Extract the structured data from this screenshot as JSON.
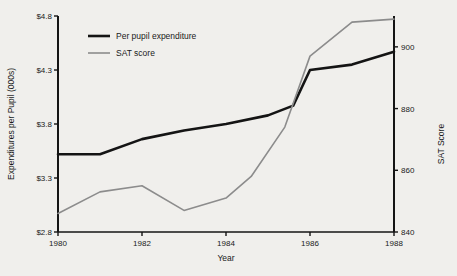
{
  "chart_data": {
    "type": "line",
    "title": "",
    "xlabel": "Year",
    "ylabel": "Expenditures per Pupil (000s)",
    "y2label": "SAT Score",
    "x": [
      1980,
      1981,
      1982,
      1983,
      1984,
      1985,
      1986,
      1987,
      1988
    ],
    "xlim": [
      1980,
      1988
    ],
    "xticks": [
      "1980",
      "1982",
      "1984",
      "1986",
      "1988"
    ],
    "xtick_values": [
      1980,
      1982,
      1984,
      1986,
      1988
    ],
    "ylim": [
      2.8,
      4.8
    ],
    "yticks": [
      "$2.8",
      "$3.3",
      "$3.8",
      "$4.3",
      "$4.8"
    ],
    "ytick_values": [
      2.8,
      3.3,
      3.8,
      4.3,
      4.8
    ],
    "y2lim": [
      840,
      910
    ],
    "y2ticks": [
      "840",
      "860",
      "880",
      "900"
    ],
    "y2tick_values": [
      840,
      860,
      880,
      900
    ],
    "grid": false,
    "legend_position": "top-left",
    "series": [
      {
        "name": "Per pupil expenditure",
        "axis": "left",
        "color": "#141414",
        "width": 2.6,
        "values": [
          3.52,
          3.52,
          3.66,
          3.74,
          3.8,
          3.88,
          3.97,
          4.3,
          4.35,
          4.47
        ],
        "x_values": [
          1980,
          1981,
          1982,
          1983,
          1984,
          1985,
          1985.6,
          1986,
          1987,
          1988
        ]
      },
      {
        "name": "SAT score",
        "axis": "right",
        "color": "#8c8c8c",
        "width": 1.6,
        "values": [
          846,
          853,
          855,
          847,
          851,
          858,
          874,
          897,
          908,
          909
        ],
        "x_values": [
          1980,
          1981,
          1982,
          1983,
          1984,
          1984.6,
          1985.4,
          1986,
          1987,
          1988
        ]
      }
    ]
  },
  "legend": {
    "items": [
      {
        "label": "Per pupil expenditure",
        "color": "#141414"
      },
      {
        "label": "SAT score",
        "color": "#8c8c8c"
      }
    ]
  },
  "colors": {
    "background": "#f0efec",
    "axis": "#141414",
    "expenditure": "#141414",
    "sat": "#8c8c8c"
  }
}
